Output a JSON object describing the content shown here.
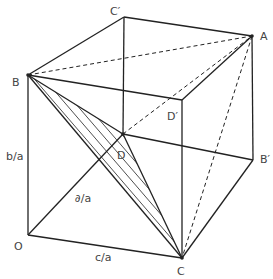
{
  "diagram": {
    "type": "cube-geometry",
    "vertices": {
      "C_prime": {
        "label": "C′",
        "x": 124,
        "y": 17
      },
      "A": {
        "label": "A",
        "x": 252,
        "y": 36
      },
      "B": {
        "label": "B",
        "x": 28,
        "y": 75
      },
      "D_prime": {
        "label": "D′",
        "x": 182,
        "y": 100
      },
      "D": {
        "label": "D",
        "x": 123,
        "y": 134
      },
      "B_prime": {
        "label": "B′",
        "x": 253,
        "y": 160
      },
      "O": {
        "label": "O",
        "x": 28,
        "y": 235
      },
      "C": {
        "label": "C",
        "x": 182,
        "y": 258
      }
    },
    "edge_labels": {
      "OB": "b/a",
      "OD": "∂/a",
      "OC": "c/a"
    },
    "solid_edges": [
      [
        "B",
        "C_prime"
      ],
      [
        "C_prime",
        "A"
      ],
      [
        "C_prime",
        "D"
      ],
      [
        "B",
        "D_prime"
      ],
      [
        "D_prime",
        "A"
      ],
      [
        "D_prime",
        "C"
      ],
      [
        "A",
        "B_prime"
      ],
      [
        "B_prime",
        "C"
      ],
      [
        "O",
        "B"
      ],
      [
        "O",
        "C"
      ],
      [
        "O",
        "D"
      ],
      [
        "D",
        "B_prime"
      ],
      [
        "B",
        "D"
      ],
      [
        "B",
        "C"
      ],
      [
        "D",
        "C"
      ]
    ],
    "dashed_edges": [
      [
        "B",
        "A"
      ],
      [
        "D",
        "A"
      ],
      [
        "A",
        "C"
      ]
    ],
    "hatched_triangle": [
      "B",
      "D",
      "C"
    ]
  }
}
